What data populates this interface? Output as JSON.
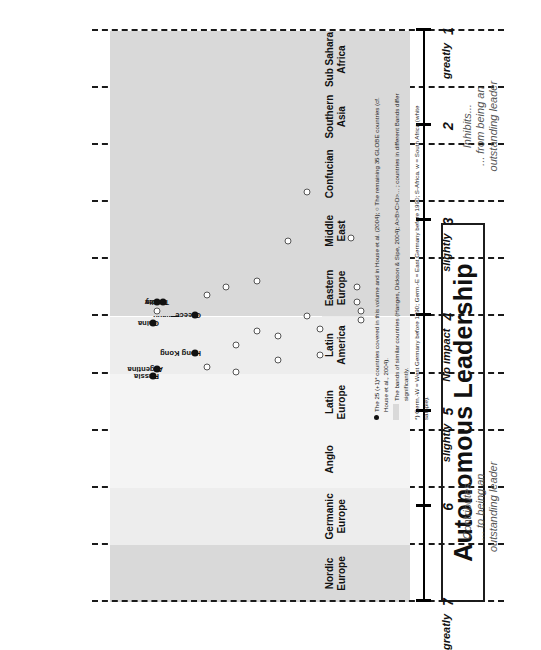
{
  "title": "Autonomous Leadership",
  "axis": {
    "ticks": [
      {
        "value": 7,
        "word": "greatly"
      },
      {
        "value": 6,
        "word": ""
      },
      {
        "value": 5,
        "word": "slightly"
      },
      {
        "value": 4,
        "word": "No impact"
      },
      {
        "value": 3,
        "word": "slightly"
      },
      {
        "value": 2,
        "word": ""
      },
      {
        "value": 1,
        "word": "greatly"
      }
    ],
    "min": 1,
    "max": 7
  },
  "anchors": {
    "top": "Contributes...\n... to being an\noutstanding leader",
    "bottom": "Inhibits...\n... from being an\noutstanding leader"
  },
  "clusters": [
    "Nordic\nEurope",
    "Germanic\nEurope",
    "Anglo",
    "Latin\nEurope",
    "Latin\nAmerica",
    "Eastern\nEurope",
    "Middle\nEast",
    "Confucian",
    "Southern\nAsia",
    "Sub Sahara\nAfrica"
  ],
  "footnote": [
    "The 25 (+1)* countries covered in this volume and in House et al. (2004);  ○  The remaining 35 GLOBE countries (cf. House et al., 2004).",
    "The bands of similar countries (Hanges, Dickson & Sipe, 2004); A>B>C>D>... ; countries in different Bands differ significantly.",
    "*) Germ.-W = West Germany before 1990; Germ.-E = East Germany before 1990; S-Africa. w = South Africa (white sample)."
  ],
  "chart_data": {
    "type": "scatter",
    "title": "Autonomous Leadership",
    "xlabel": "",
    "ylabel": "",
    "ylim": [
      1,
      7
    ],
    "grid": true,
    "legend": "none",
    "clusters": [
      {
        "name": "Nordic Europe",
        "band": "A",
        "points": [
          {
            "label": "Finland",
            "value": 4.0,
            "type": "filled"
          },
          {
            "label": "Sweden",
            "value": 3.94,
            "type": "filled"
          },
          {
            "label": "",
            "value": 3.75,
            "type": "open"
          }
        ]
      },
      {
        "name": "Germanic Europe",
        "band": "A",
        "points": [
          {
            "label": "Austria",
            "value": 4.47,
            "type": "filled"
          },
          {
            "label": "Germ.-E",
            "value": 4.35,
            "type": "filled"
          },
          {
            "label": "Germ.-W",
            "value": 4.3,
            "type": "filled"
          },
          {
            "label": "Switzerl.",
            "value": 4.18,
            "type": "filled"
          },
          {
            "label": "",
            "value": 3.32,
            "type": "open"
          },
          {
            "label": "",
            "value": 4.62,
            "type": "open"
          }
        ]
      },
      {
        "name": "Anglo",
        "band": "B",
        "points": [
          {
            "label": "Ireland",
            "value": 3.95,
            "type": "filled"
          },
          {
            "label": "Australia",
            "value": 3.95,
            "type": "filled"
          },
          {
            "label": "England",
            "value": 3.92,
            "type": "filled"
          },
          {
            "label": "New Zeal.",
            "value": 3.77,
            "type": "filled"
          },
          {
            "label": "USA",
            "value": 3.75,
            "type": "filled"
          },
          {
            "label": "S-Africa.w",
            "value": 3.74,
            "type": "filled"
          },
          {
            "label": "",
            "value": 3.66,
            "type": "open"
          },
          {
            "label": "",
            "value": 3.2,
            "type": "open"
          }
        ]
      },
      {
        "name": "Latin Europe",
        "band": "C",
        "points": [
          {
            "label": "Netherl.",
            "value": 3.53,
            "type": "filled"
          },
          {
            "label": "Spain",
            "value": 3.54,
            "type": "filled"
          },
          {
            "label": "France",
            "value": 3.32,
            "type": "filled"
          },
          {
            "label": "Portugal",
            "value": 3.19,
            "type": "filled"
          },
          {
            "label": "",
            "value": 3.85,
            "type": "open"
          },
          {
            "label": "",
            "value": 3.67,
            "type": "open"
          }
        ]
      },
      {
        "name": "Latin America",
        "band": "C",
        "points": [
          {
            "label": "Argentina",
            "value": 4.55,
            "type": "filled"
          },
          {
            "label": "Mexico",
            "value": 3.86,
            "type": "filled"
          },
          {
            "label": "Colombia",
            "value": 3.34,
            "type": "filled"
          },
          {
            "label": "",
            "value": 3.51,
            "type": "open"
          },
          {
            "label": "",
            "value": 3.41,
            "type": "open"
          }
        ]
      },
      {
        "name": "Eastern Europe",
        "band": "A",
        "points": [
          {
            "label": "Russia",
            "value": 4.63,
            "type": "filled"
          },
          {
            "label": "Greece",
            "value": 3.98,
            "type": "filled"
          },
          {
            "label": "",
            "value": 4.58,
            "type": "open"
          },
          {
            "label": "",
            "value": 4.46,
            "type": "open"
          },
          {
            "label": "",
            "value": 4.4,
            "type": "open"
          },
          {
            "label": "",
            "value": 3.94,
            "type": "open"
          }
        ]
      },
      {
        "name": "Middle East",
        "band": "B",
        "points": [
          {
            "label": "Turkey",
            "value": 3.85,
            "type": "filled"
          },
          {
            "label": "",
            "value": 3.69,
            "type": "open"
          },
          {
            "label": "",
            "value": 3.21,
            "type": "open"
          },
          {
            "label": "",
            "value": 3.18,
            "type": "open"
          }
        ]
      },
      {
        "name": "Confucian",
        "band": "A",
        "points": [
          {
            "label": "China",
            "value": 4.07,
            "type": "filled"
          },
          {
            "label": "Hong Kong",
            "value": 4.38,
            "type": "filled"
          },
          {
            "label": "",
            "value": 4.3,
            "type": "open"
          },
          {
            "label": "",
            "value": 4.2,
            "type": "open"
          },
          {
            "label": "",
            "value": 4.13,
            "type": "open"
          },
          {
            "label": "",
            "value": 4.04,
            "type": "open"
          }
        ]
      },
      {
        "name": "Southern Asia",
        "band": "A",
        "points": [
          {
            "label": "India",
            "value": 3.85,
            "type": "filled"
          },
          {
            "label": "",
            "value": 4.53,
            "type": "open"
          },
          {
            "label": "",
            "value": 4.15,
            "type": "open"
          },
          {
            "label": "",
            "value": 3.99,
            "type": "open"
          },
          {
            "label": "",
            "value": 3.85,
            "type": "open"
          }
        ]
      },
      {
        "name": "Sub Sahara Africa",
        "band": "C",
        "points": [
          {
            "label": "",
            "value": 3.94,
            "type": "open"
          },
          {
            "label": "",
            "value": 3.77,
            "type": "open"
          },
          {
            "label": "",
            "value": 3.63,
            "type": "open"
          },
          {
            "label": "",
            "value": 2.69,
            "type": "open"
          },
          {
            "label": "",
            "value": 3.69,
            "type": "open"
          }
        ]
      }
    ]
  }
}
